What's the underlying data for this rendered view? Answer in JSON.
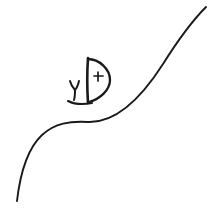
{
  "image": {
    "title": "Hand-drawn sketch",
    "description": "Black ink line drawing on a white background showing a small sail-like D shape with a cross mark, resting on a long S-curved slope line.",
    "background_color": "#ffffff",
    "ink_color": "#1a1a1a",
    "width": 211,
    "height": 216,
    "style": "hand-drawn pen sketch"
  },
  "shapes": {
    "slope_line": {
      "name": "slope-curve",
      "label": "S-shaped slope line",
      "path": "M 17 201 C 20 175, 26 150, 42 135 C 55 123, 70 121, 88 122 C 115 123, 140 100, 163 64 C 180 37, 195 18, 206 7",
      "stroke_width": 1.9
    },
    "sail_arc": {
      "name": "sail-arc",
      "label": "Semicircular sail bulge",
      "path": "M 88 59 C 99 59, 110 69, 110 80 C 110 90, 100 99, 89 102",
      "stroke_width": 2.3
    },
    "mast_line": {
      "name": "mast-line",
      "label": "Vertical mast stroke",
      "path": "M 88 58 C 87 72, 87 87, 88 103",
      "stroke_width": 2.6
    },
    "hull_line": {
      "name": "hull-line",
      "label": "Hull base stroke",
      "path": "M 68 101 C 74 104, 82 105, 92 103",
      "stroke_width": 2.1
    },
    "tick_mark": {
      "name": "y-tick-mark",
      "label": "Y shaped tick mark left of sail",
      "paths": [
        "M 70 81 C 71 85, 73 88, 75 90",
        "M 79 81 C 78 85, 77 88, 75 90",
        "M 75 90 C 75 94, 75 97, 74 100"
      ],
      "stroke_width": 2.0
    },
    "plus_mark": {
      "name": "plus-mark",
      "label": "Small cross / plus inside the sail",
      "paths": [
        "M 98 72 L 98 81",
        "M 94 76 L 103 76"
      ],
      "stroke_width": 1.7
    }
  }
}
